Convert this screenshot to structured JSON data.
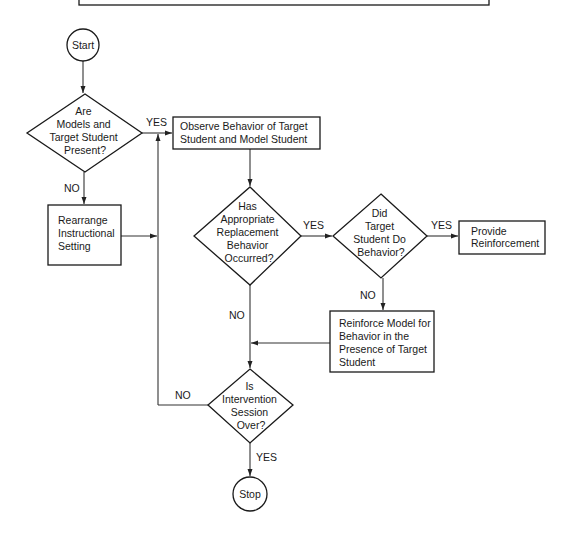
{
  "diagram": {
    "type": "flowchart",
    "nodes": {
      "start": {
        "label": "Start",
        "shape": "circle"
      },
      "q_models_present": {
        "lines": [
          "Are",
          "Models and",
          "Target Student",
          "Present?"
        ],
        "shape": "diamond"
      },
      "rearrange": {
        "lines": [
          "Rearrange",
          "Instructional",
          "Setting"
        ],
        "shape": "box"
      },
      "observe": {
        "lines": [
          "Observe Behavior of Target",
          "Student and Model Student"
        ],
        "shape": "box"
      },
      "q_replacement": {
        "lines": [
          "Has",
          "Appropriate",
          "Replacement",
          "Behavior",
          "Occurred?"
        ],
        "shape": "diamond"
      },
      "q_target_did": {
        "lines": [
          "Did",
          "Target",
          "Student Do",
          "Behavior?"
        ],
        "shape": "diamond"
      },
      "provide": {
        "lines": [
          "Provide",
          "Reinforcement"
        ],
        "shape": "box"
      },
      "reinforce_model": {
        "lines": [
          "Reinforce Model for",
          "Behavior in the",
          "Presence of Target",
          "Student"
        ],
        "shape": "box"
      },
      "q_session_over": {
        "lines": [
          "Is",
          "Intervention",
          "Session",
          "Over?"
        ],
        "shape": "diamond"
      },
      "stop": {
        "label": "Stop",
        "shape": "circle"
      }
    },
    "edge_labels": {
      "models_yes": "YES",
      "models_no": "NO",
      "replacement_yes": "YES",
      "replacement_no": "NO",
      "target_yes": "YES",
      "target_no": "NO",
      "session_no": "NO",
      "session_yes": "YES"
    },
    "edges": [
      {
        "from": "start",
        "to": "q_models_present"
      },
      {
        "from": "q_models_present",
        "to": "observe",
        "label": "YES"
      },
      {
        "from": "q_models_present",
        "to": "rearrange",
        "label": "NO"
      },
      {
        "from": "rearrange",
        "to": "observe"
      },
      {
        "from": "observe",
        "to": "q_replacement"
      },
      {
        "from": "q_replacement",
        "to": "q_target_did",
        "label": "YES"
      },
      {
        "from": "q_replacement",
        "to": "q_session_over",
        "label": "NO"
      },
      {
        "from": "q_target_did",
        "to": "provide",
        "label": "YES"
      },
      {
        "from": "q_target_did",
        "to": "reinforce_model",
        "label": "NO"
      },
      {
        "from": "reinforce_model",
        "to": "q_session_over"
      },
      {
        "from": "q_session_over",
        "to": "observe",
        "label": "NO"
      },
      {
        "from": "q_session_over",
        "to": "stop",
        "label": "YES"
      }
    ]
  }
}
